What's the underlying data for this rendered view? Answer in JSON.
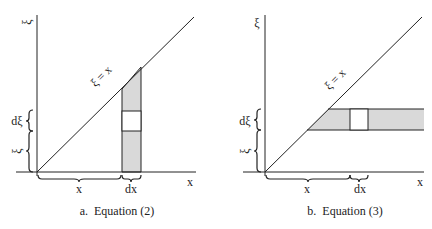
{
  "colors": {
    "line": "#222222",
    "shade": "#d9d9d9",
    "background": "#ffffff"
  },
  "panels": [
    {
      "id": "a",
      "caption": "a.  Equation (2)",
      "y_axis_label": "ξ",
      "x_axis_label": "x",
      "diagonal_label": "ξ = x",
      "brace_labels": {
        "d_xi": "dξ",
        "xi": "ξ",
        "x": "x",
        "dx": "dx"
      },
      "shading": "vertical strip of width dx from x-axis to line ξ = x, with white element dξ"
    },
    {
      "id": "b",
      "caption": "b.  Equation (3)",
      "y_axis_label": "ξ",
      "x_axis_label": "x",
      "diagonal_label": "ξ = x",
      "brace_labels": {
        "d_xi": "dξ",
        "xi": "ξ",
        "x": "x",
        "dx": "dx"
      },
      "shading": "horizontal strip of height dξ from line ξ = x to right edge, with white element dx"
    }
  ]
}
